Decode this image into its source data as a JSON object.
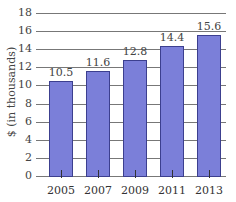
{
  "chart_data": {
    "type": "bar",
    "title": "",
    "xlabel": "",
    "ylabel": "$ (in thousands)",
    "categories": [
      "2005",
      "2007",
      "2009",
      "2011",
      "2013"
    ],
    "values": [
      10.5,
      11.6,
      12.8,
      14.4,
      15.6
    ],
    "value_labels": [
      "10.5",
      "11.6",
      "12.8",
      "14.4",
      "15.6"
    ],
    "ylim": [
      0,
      18
    ],
    "yticks": [
      "0",
      "2",
      "4",
      "6",
      "8",
      "10",
      "12",
      "14",
      "16",
      "18"
    ],
    "grid": true,
    "legend": null,
    "bar_color": "#7b7fd9"
  }
}
